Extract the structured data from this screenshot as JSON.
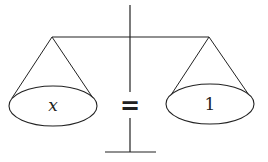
{
  "diagram": {
    "type": "balance-scale",
    "left_pan": {
      "label": "x"
    },
    "right_pan": {
      "label": "1"
    },
    "relation": "=",
    "colors": {
      "stroke": "#222222",
      "background": "#ffffff"
    }
  }
}
